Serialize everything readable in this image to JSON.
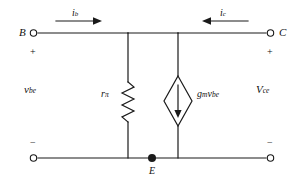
{
  "diagram": {
    "type": "circuit-schematic",
    "title_visible": false,
    "colors": {
      "wire": "#1a1a1a",
      "text": "#111111",
      "background": "#ffffff"
    },
    "terminals": {
      "base": {
        "label": "B",
        "polarity": "+",
        "position": "top-left",
        "marker": "open-circle"
      },
      "collector": {
        "label": "C",
        "polarity": "+",
        "position": "top-right",
        "marker": "open-circle"
      },
      "emitter_node": {
        "label": "E",
        "position": "bottom-center",
        "marker": "filled-dot"
      },
      "bottom_left": {
        "polarity": "−",
        "marker": "open-circle"
      },
      "bottom_right": {
        "polarity": "−",
        "marker": "open-circle"
      }
    },
    "currents": [
      {
        "symbol": "i",
        "subscript": "b",
        "direction": "right",
        "location": "top-left-branch"
      },
      {
        "symbol": "i",
        "subscript": "c",
        "direction": "left",
        "location": "top-right-branch"
      }
    ],
    "voltages": [
      {
        "symbol": "v",
        "subscript": "be",
        "location": "left-port"
      },
      {
        "symbol": "V",
        "subscript": "ce",
        "location": "right-port"
      }
    ],
    "components": [
      {
        "kind": "resistor",
        "symbol": "r",
        "subscript": "π",
        "orientation": "vertical",
        "style": "zigzag"
      },
      {
        "kind": "dependent-current-source",
        "symbol_prefix": "g",
        "symbol_prefix_sub": "m",
        "symbol_suffix": "v",
        "symbol_suffix_sub": "be",
        "orientation": "vertical",
        "arrow_direction": "down",
        "style": "diamond"
      }
    ]
  }
}
